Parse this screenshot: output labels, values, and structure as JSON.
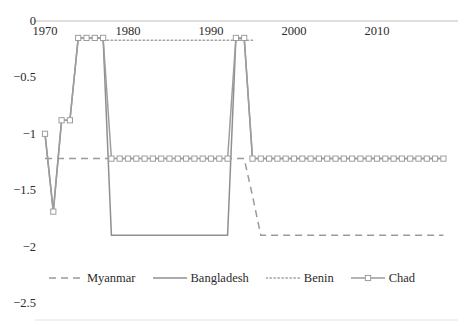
{
  "chart_data": {
    "type": "line",
    "title": "",
    "subtitle": "",
    "xlabel": "",
    "ylabel": "",
    "xlim": [
      1969,
      2018
    ],
    "ylim": [
      -2.5,
      0
    ],
    "grid": false,
    "legend_position": "bottom",
    "x_ticks": [
      "1970",
      "1980",
      "1990",
      "2000",
      "2010"
    ],
    "x_tick_values": [
      1970,
      1980,
      1990,
      2000,
      2010
    ],
    "y_ticks": [
      "0",
      "−0.5",
      "−1",
      "−1.5",
      "−2",
      "−2.5"
    ],
    "y_tick_values": [
      0,
      -0.5,
      -1,
      -1.5,
      -2,
      -2.5
    ],
    "series": [
      {
        "name": "Myanmar",
        "style": "dashed",
        "color": "#9a9a9a",
        "marker": "none",
        "x": [
          1970,
          1971,
          1972,
          1973,
          1974,
          1975,
          1976,
          1977,
          1978,
          1979,
          1980,
          1981,
          1982,
          1983,
          1984,
          1985,
          1986,
          1987,
          1988,
          1989,
          1990,
          1991,
          1992,
          1993,
          1994,
          1995,
          1996,
          1997,
          1998,
          1999,
          2000,
          2001,
          2002,
          2003,
          2004,
          2005,
          2006,
          2007,
          2008,
          2009,
          2010,
          2011,
          2012,
          2013,
          2014,
          2015,
          2016,
          2017,
          2018
        ],
        "values": [
          -1.22,
          -1.22,
          -1.22,
          -1.22,
          -1.22,
          -1.22,
          -1.22,
          -1.22,
          -1.22,
          -1.22,
          -1.22,
          -1.22,
          -1.22,
          -1.22,
          -1.22,
          -1.22,
          -1.22,
          -1.22,
          -1.22,
          -1.22,
          -1.22,
          -1.22,
          -1.22,
          -1.22,
          -1.22,
          -1.55,
          -1.9,
          -1.9,
          -1.9,
          -1.9,
          -1.9,
          -1.9,
          -1.9,
          -1.9,
          -1.9,
          -1.9,
          -1.9,
          -1.9,
          -1.9,
          -1.9,
          -1.9,
          -1.9,
          -1.9,
          -1.9,
          -1.9,
          -1.9,
          -1.9,
          -1.9,
          -1.9
        ]
      },
      {
        "name": "Bangladesh",
        "style": "solid",
        "color": "#8f8f8f",
        "marker": "none",
        "x": [
          1970,
          1971,
          1972,
          1973,
          1974,
          1975,
          1976,
          1977,
          1978,
          1979,
          1980,
          1981,
          1982,
          1983,
          1984,
          1985,
          1986,
          1987,
          1988,
          1989,
          1990,
          1991,
          1992,
          1993,
          1994,
          1995,
          1996,
          1997,
          1998,
          1999,
          2000,
          2001,
          2002,
          2003,
          2004,
          2005,
          2006,
          2007,
          2008,
          2009,
          2010,
          2011,
          2012,
          2013,
          2014,
          2015,
          2016,
          2017,
          2018
        ],
        "values": [
          -1.0,
          -1.69,
          -0.88,
          -0.88,
          -0.15,
          -0.15,
          -0.15,
          -0.15,
          -1.9,
          -1.9,
          -1.9,
          -1.9,
          -1.9,
          -1.9,
          -1.9,
          -1.9,
          -1.9,
          -1.9,
          -1.9,
          -1.9,
          -1.9,
          -1.9,
          -1.9,
          -0.15,
          -0.15,
          -1.22,
          -1.22,
          -1.22,
          -1.22,
          -1.22,
          -1.22,
          -1.22,
          -1.22,
          -1.22,
          -1.22,
          -1.22,
          -1.22,
          -1.22,
          -1.22,
          -1.22,
          -1.22,
          -1.22,
          -1.22,
          -1.22,
          -1.22,
          -1.22,
          -1.22,
          -1.22,
          -1.22
        ]
      },
      {
        "name": "Benin",
        "style": "dotted",
        "color": "#a3a3a3",
        "marker": "none",
        "x": [
          1977,
          1978,
          1979,
          1980,
          1981,
          1982,
          1983,
          1984,
          1985,
          1986,
          1987,
          1988,
          1989,
          1990,
          1991,
          1992,
          1993,
          1994,
          1995
        ],
        "values": [
          -0.17,
          -0.17,
          -0.17,
          -0.17,
          -0.17,
          -0.17,
          -0.17,
          -0.17,
          -0.17,
          -0.17,
          -0.17,
          -0.17,
          -0.17,
          -0.17,
          -0.17,
          -0.17,
          -0.17,
          -0.17,
          -0.17
        ]
      },
      {
        "name": "Chad",
        "style": "solid",
        "color": "#9d9d9d",
        "marker": "square",
        "x": [
          1970,
          1971,
          1972,
          1973,
          1974,
          1975,
          1976,
          1977,
          1978,
          1979,
          1980,
          1981,
          1982,
          1983,
          1984,
          1985,
          1986,
          1987,
          1988,
          1989,
          1990,
          1991,
          1992,
          1993,
          1994,
          1995,
          1996,
          1997,
          1998,
          1999,
          2000,
          2001,
          2002,
          2003,
          2004,
          2005,
          2006,
          2007,
          2008,
          2009,
          2010,
          2011,
          2012,
          2013,
          2014,
          2015,
          2016,
          2017,
          2018
        ],
        "values": [
          -1.0,
          -1.69,
          -0.88,
          -0.88,
          -0.15,
          -0.15,
          -0.15,
          -0.15,
          -1.22,
          -1.22,
          -1.22,
          -1.22,
          -1.22,
          -1.22,
          -1.22,
          -1.22,
          -1.22,
          -1.22,
          -1.22,
          -1.22,
          -1.22,
          -1.22,
          -1.22,
          -0.15,
          -0.15,
          -1.22,
          -1.22,
          -1.22,
          -1.22,
          -1.22,
          -1.22,
          -1.22,
          -1.22,
          -1.22,
          -1.22,
          -1.22,
          -1.22,
          -1.22,
          -1.22,
          -1.22,
          -1.22,
          -1.22,
          -1.22,
          -1.22,
          -1.22,
          -1.22,
          -1.22,
          -1.22,
          -1.22
        ]
      }
    ]
  },
  "legend": {
    "items": [
      {
        "label": "Myanmar"
      },
      {
        "label": "Bangladesh"
      },
      {
        "label": "Benin"
      },
      {
        "label": "Chad"
      }
    ]
  },
  "colors": {
    "axis": "#b4b4b4",
    "text": "#2b2b2b",
    "myanmar": "#9a9a9a",
    "bangladesh": "#8f8f8f",
    "benin": "#a3a3a3",
    "chad": "#9d9d9d"
  }
}
